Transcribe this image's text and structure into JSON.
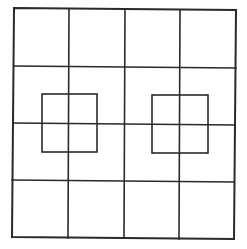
{
  "figure": {
    "width": 247,
    "height": 249,
    "background": "#ffffff",
    "stroke_color": "#2a2a2a",
    "outer_stroke_width": 2,
    "grid_stroke_width": 1.6,
    "inner_stroke_width": 1.6
  },
  "outer_square": {
    "corners": [
      [
        14,
        8
      ],
      [
        236,
        10
      ],
      [
        234,
        239
      ],
      [
        12,
        237
      ]
    ]
  },
  "grid": {
    "rows": 4,
    "cols": 4,
    "vertical_lines": [
      {
        "x1": 69,
        "y1": 9,
        "x2": 68,
        "y2": 238
      },
      {
        "x1": 125,
        "y1": 9,
        "x2": 124,
        "y2": 238
      },
      {
        "x1": 180,
        "y1": 10,
        "x2": 179,
        "y2": 239
      }
    ],
    "horizontal_lines": [
      {
        "x1": 14,
        "y1": 66,
        "x2": 236,
        "y2": 68
      },
      {
        "x1": 13,
        "y1": 123,
        "x2": 235,
        "y2": 125
      },
      {
        "x1": 12,
        "y1": 180,
        "x2": 234,
        "y2": 182
      }
    ]
  },
  "inner_squares": [
    {
      "name": "left-inner-square",
      "x": 42,
      "y": 94,
      "width": 55,
      "height": 58
    },
    {
      "name": "right-inner-square",
      "x": 152,
      "y": 95,
      "width": 56,
      "height": 58
    }
  ]
}
